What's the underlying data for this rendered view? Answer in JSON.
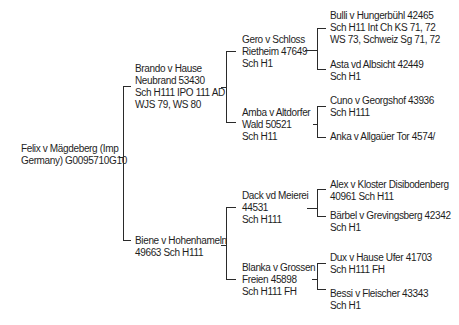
{
  "pedigree": {
    "root": {
      "lines": [
        "Felix v Mägdeberg (Imp",
        "Germany) G0095710G10"
      ]
    },
    "sire": {
      "lines": [
        "Brando v Hause",
        "Neubrand 53430",
        "Sch H111 IPO 111 AD",
        "WJS 79, WS 80"
      ]
    },
    "dam": {
      "lines": [
        "Biene v Hohenhameln",
        "49663 Sch H111"
      ]
    },
    "sire_sire": {
      "lines": [
        "Gero v Schloss",
        "Rietheim 47649",
        "Sch H1"
      ]
    },
    "sire_dam": {
      "lines": [
        "Amba v Altdorfer",
        "Wald 50521",
        "Sch H11"
      ]
    },
    "dam_sire": {
      "lines": [
        "Dack vd Meierei",
        "44531",
        "Sch H111"
      ]
    },
    "dam_dam": {
      "lines": [
        "Blanka v Grossen",
        "Freien 45898",
        "Sch H111 FH"
      ]
    },
    "ss_sire": {
      "lines": [
        "Bulli v Hungerbühl 42465",
        "Sch H11 Int Ch KS 71, 72",
        "WS 73, Schweiz Sg 71, 72"
      ]
    },
    "ss_dam": {
      "lines": [
        "Asta vd Albsicht 42449",
        "Sch H1"
      ]
    },
    "sd_sire": {
      "lines": [
        "Cuno v Georgshof 43936",
        "Sch H111"
      ]
    },
    "sd_dam": {
      "lines": [
        "Anka v Allgaüer Tor 4574/"
      ]
    },
    "ds_sire": {
      "lines": [
        "Alex v Kloster Disibodenberg",
        "40961 Sch H11"
      ]
    },
    "ds_dam": {
      "lines": [
        "Bärbel v Grevingsberg 42342",
        "Sch H1"
      ]
    },
    "dd_sire": {
      "lines": [
        "Dux v Hause Ufer 41703",
        "Sch H111 FH"
      ]
    },
    "dd_dam": {
      "lines": [
        "Bessi v Fleischer 43343",
        "Sch H1"
      ]
    }
  },
  "colors": {
    "text": "#1e1e1e",
    "lines": "#2a2a2a",
    "background": "#ffffff"
  }
}
